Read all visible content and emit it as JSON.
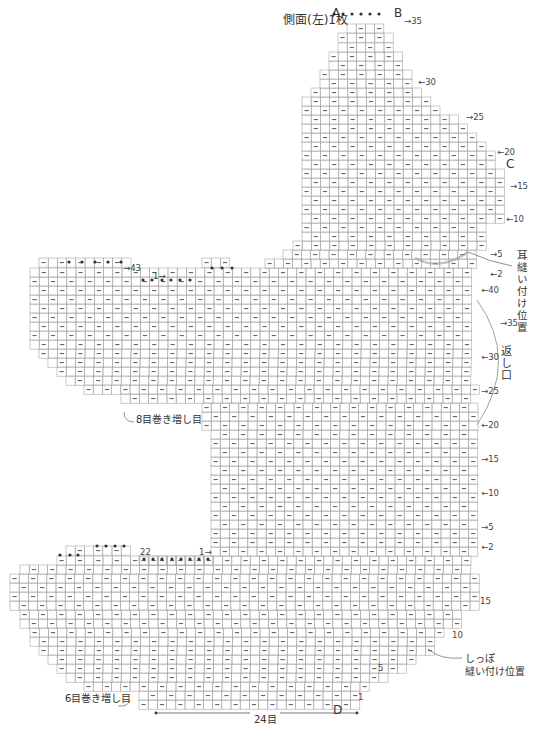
{
  "title": "側面(左)1枚",
  "letters": {
    "A": "A",
    "B": "B",
    "C": "C",
    "D": "D"
  },
  "width_label": "24目",
  "notes": {
    "ear_position": "耳縫い付け位置",
    "return_opening": "返し口",
    "tail_position_line1": "しっぽ",
    "tail_position_line2": "縫い付け位置",
    "cast_on_8": "8目巻き増し目",
    "cast_on_6": "6目巻き増し目"
  },
  "row_labels": {
    "head_right": [
      "35",
      "30",
      "25",
      "20",
      "15",
      "10",
      "5",
      "2"
    ],
    "body_right": [
      "40",
      "35",
      "30",
      "25",
      "20",
      "15",
      "10",
      "5",
      "2"
    ],
    "lower_right": [
      "15",
      "10",
      "5",
      "1"
    ],
    "arm_top": "43",
    "mid_marker": "1",
    "lower_left_top": "22",
    "lower_marker": "1"
  },
  "symbols": {
    "purl": "—",
    "increase_twist": "ℛ",
    "cast_on_loop": "ℚ",
    "decrease_left": "⋌",
    "decrease_right": "⋋",
    "bind_off": "●"
  },
  "colors": {
    "grid_line": "#a8a8a8",
    "symbol": "#555555",
    "ear_arc": "#9a9a9a",
    "text": "#333333"
  },
  "chart_data": {
    "type": "table",
    "title": "側面(左)1枚",
    "cell_px": 9.2,
    "total_width_stitches": 24,
    "sections": [
      {
        "name": "head",
        "rows": 35,
        "top_stitches": 4,
        "markers": [
          "A",
          "B",
          "C"
        ]
      },
      {
        "name": "body",
        "rows": 43,
        "left_arm_cast_on": 8
      },
      {
        "name": "lower",
        "rows": 22,
        "left_leg_cast_on": 6,
        "bottom_marker": "D"
      }
    ]
  }
}
